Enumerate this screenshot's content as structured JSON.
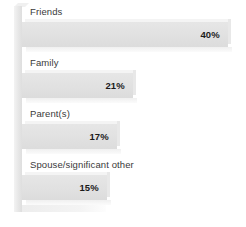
{
  "chart_data": {
    "type": "bar",
    "orientation": "horizontal",
    "title": "",
    "subtitle": "",
    "xlabel": "",
    "ylabel": "",
    "grid": false,
    "legend": false,
    "value_suffix": "%",
    "categories": [
      "Friends",
      "Family",
      "Parent(s)",
      "Spouse/significant other"
    ],
    "values": [
      40,
      21,
      17,
      15
    ],
    "value_labels": [
      "40%",
      "21%",
      "17%",
      "15%"
    ],
    "xlim": [
      0,
      40
    ],
    "bars": [
      {
        "label": "Friends",
        "value": 40,
        "value_label": "40%",
        "bar_px": 206,
        "top_px": 6
      },
      {
        "label": "Family",
        "value": 21,
        "value_label": "21%",
        "bar_px": 111,
        "top_px": 57
      },
      {
        "label": "Parent(s)",
        "value": 17,
        "value_label": "17%",
        "bar_px": 95,
        "top_px": 108
      },
      {
        "label": "Spouse/significant other",
        "value": 15,
        "value_label": "15%",
        "bar_px": 85,
        "top_px": 159
      }
    ],
    "colors": {
      "background": "#ffffff",
      "bar_fill": "#e1e1e1",
      "bar_top": "#f4f4f4",
      "bar_side": "#e8e8e8",
      "axis_wall": "#e9e9e9",
      "label_text": "#3a3a3a",
      "value_text": "#1a1a1a"
    }
  }
}
